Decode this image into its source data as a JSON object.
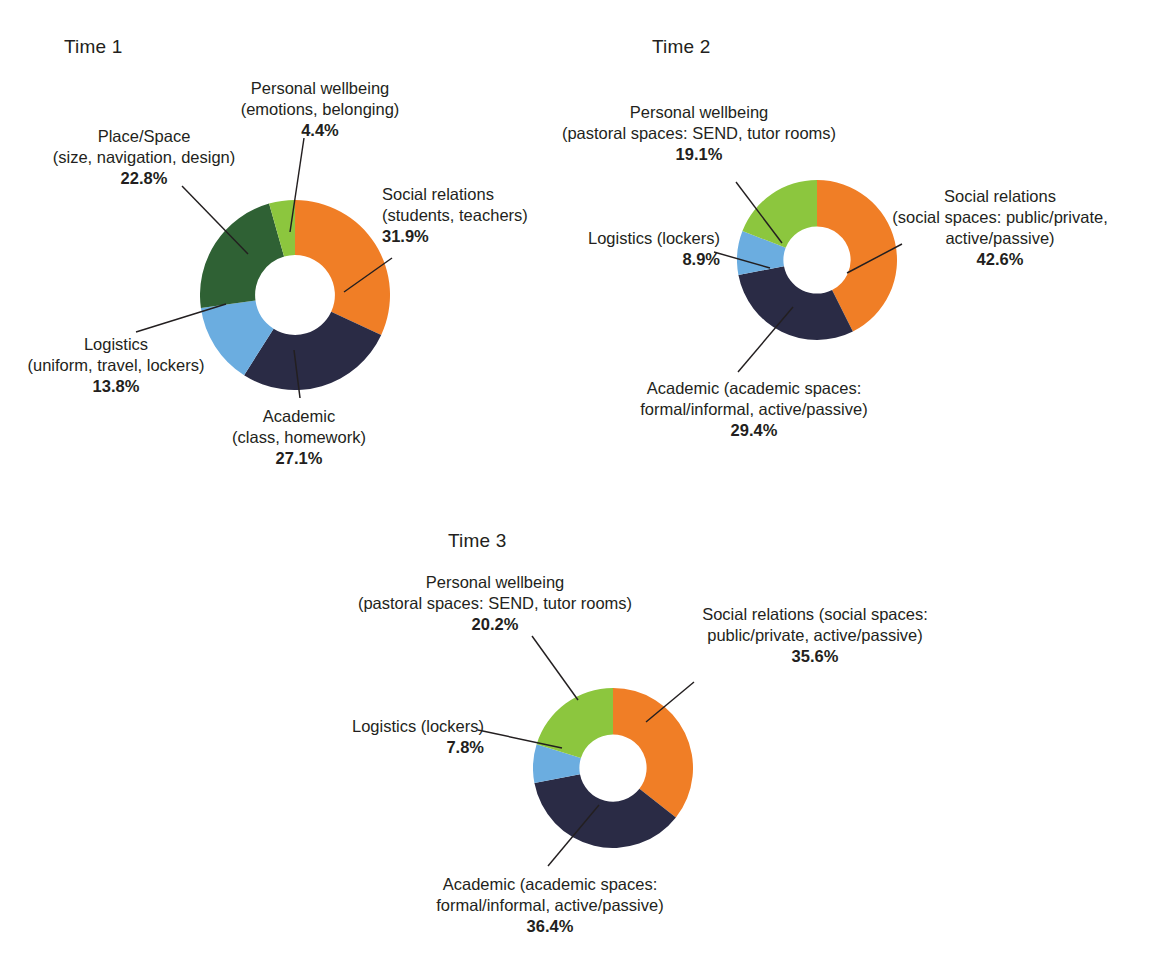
{
  "figure": {
    "top_cropped_text": "",
    "palette": {
      "social_relations": "#F07E26",
      "academic": "#2A2B45",
      "logistics": "#6BADE0",
      "place_space": "#2F6134",
      "personal_wellbeing": "#8CC63E",
      "background": "#FFFFFF",
      "text": "#231F20"
    }
  },
  "charts": [
    {
      "title": "Time 1",
      "labels": {
        "personal_wellbeing": {
          "line1": "Personal wellbeing",
          "line2": "(emotions, belonging)",
          "pct": "4.4%"
        },
        "place_space": {
          "line1": "Place/Space",
          "line2": "(size, navigation, design)",
          "pct": "22.8%"
        },
        "social_relations": {
          "line1": "Social relations",
          "line2": "(students, teachers)",
          "pct": "31.9%"
        },
        "logistics": {
          "line1": "Logistics",
          "line2": "(uniform, travel, lockers)",
          "pct": "13.8%"
        },
        "academic": {
          "line1": "Academic",
          "line2": "(class, homework)",
          "pct": "27.1%"
        }
      }
    },
    {
      "title": "Time 2",
      "labels": {
        "personal_wellbeing": {
          "line1": "Personal wellbeing",
          "line2": "(pastoral spaces: SEND, tutor rooms)",
          "pct": "19.1%"
        },
        "social_relations": {
          "line1": "Social relations",
          "line2": "(social spaces: public/private,",
          "line3": "active/passive)",
          "pct": "42.6%"
        },
        "logistics": {
          "line1": "Logistics (lockers)",
          "pct": "8.9%"
        },
        "academic": {
          "line1": "Academic (academic spaces:",
          "line2": "formal/informal, active/passive)",
          "pct": "29.4%"
        }
      }
    },
    {
      "title": "Time 3",
      "labels": {
        "personal_wellbeing": {
          "line1": "Personal wellbeing",
          "line2": "(pastoral spaces: SEND, tutor rooms)",
          "pct": "20.2%"
        },
        "social_relations": {
          "line1": "Social relations (social spaces:",
          "line2": "public/private, active/passive)",
          "pct": "35.6%"
        },
        "logistics": {
          "line1": "Logistics (lockers)",
          "pct": "7.8%"
        },
        "academic": {
          "line1": "Academic (academic spaces:",
          "line2": "formal/informal, active/passive)",
          "pct": "36.4%"
        }
      }
    }
  ],
  "chart_data": [
    {
      "type": "pie",
      "title": "Time 1",
      "donut": true,
      "inner_radius_ratio": 0.42,
      "start_angle_deg": 0,
      "direction": "clockwise",
      "categories": [
        "Social relations (students, teachers)",
        "Academic (class, homework)",
        "Logistics (uniform, travel, lockers)",
        "Place/Space (size, navigation, design)",
        "Personal wellbeing (emotions, belonging)"
      ],
      "values": [
        31.9,
        27.1,
        13.8,
        22.8,
        4.4
      ],
      "unit": "%",
      "colors": [
        "#F07E26",
        "#2A2B45",
        "#6BADE0",
        "#2F6134",
        "#8CC63E"
      ],
      "legend": "labels-with-leader-lines"
    },
    {
      "type": "pie",
      "title": "Time 2",
      "donut": true,
      "inner_radius_ratio": 0.42,
      "start_angle_deg": 0,
      "direction": "clockwise",
      "categories": [
        "Social relations (social spaces: public/private, active/passive)",
        "Academic (academic spaces: formal/informal, active/passive)",
        "Logistics (lockers)",
        "Personal wellbeing (pastoral spaces: SEND, tutor rooms)"
      ],
      "values": [
        42.6,
        29.4,
        8.9,
        19.1
      ],
      "unit": "%",
      "colors": [
        "#F07E26",
        "#2A2B45",
        "#6BADE0",
        "#8CC63E"
      ],
      "legend": "labels-with-leader-lines"
    },
    {
      "type": "pie",
      "title": "Time 3",
      "donut": true,
      "inner_radius_ratio": 0.42,
      "start_angle_deg": 0,
      "direction": "clockwise",
      "categories": [
        "Social relations (social spaces: public/private, active/passive)",
        "Academic (academic spaces: formal/informal, active/passive)",
        "Logistics (lockers)",
        "Personal wellbeing (pastoral spaces: SEND, tutor rooms)"
      ],
      "values": [
        35.6,
        36.4,
        7.8,
        20.2
      ],
      "unit": "%",
      "colors": [
        "#F07E26",
        "#2A2B45",
        "#6BADE0",
        "#8CC63E"
      ],
      "legend": "labels-with-leader-lines"
    }
  ]
}
